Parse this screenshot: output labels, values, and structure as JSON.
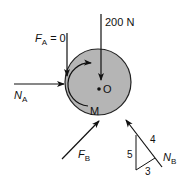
{
  "diagram": {
    "type": "free-body-diagram",
    "body": {
      "label_center": "O",
      "moment_label": "M",
      "fill": "#b5b5b5"
    },
    "forces": {
      "applied_load": {
        "value": "200 N",
        "direction": "down"
      },
      "friction_A": {
        "symbol": "F",
        "subscript": "A",
        "value_text": " = 0",
        "direction": "down"
      },
      "normal_A": {
        "symbol": "N",
        "subscript": "A",
        "direction": "right"
      },
      "friction_B": {
        "symbol": "F",
        "subscript": "B",
        "direction": "up-right"
      },
      "normal_B": {
        "symbol": "N",
        "subscript": "B",
        "direction": "up-left"
      }
    },
    "slope_triangle": {
      "rise": "5",
      "run": "3",
      "hypotenuse": "4"
    }
  }
}
